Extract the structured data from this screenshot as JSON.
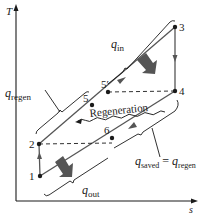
{
  "diagram": {
    "axes": {
      "y_label": "T",
      "x_label": "s"
    },
    "states": [
      {
        "id": "1",
        "label": "1"
      },
      {
        "id": "2",
        "label": "2"
      },
      {
        "id": "3",
        "label": "3"
      },
      {
        "id": "4",
        "label": "4"
      },
      {
        "id": "5",
        "label": "5"
      },
      {
        "id": "5p",
        "label": "5′"
      },
      {
        "id": "6",
        "label": "6"
      }
    ],
    "annotations": {
      "q_in": {
        "symbol": "q",
        "sub": "in"
      },
      "q_regen": {
        "symbol": "q",
        "sub": "regen"
      },
      "q_out": {
        "symbol": "q",
        "sub": "out"
      },
      "q_saved": {
        "symbol": "q",
        "sub": "saved",
        "equals": " = ",
        "symbol2": "q",
        "sub2": "regen"
      },
      "regeneration": "Regeneration"
    },
    "colors": {
      "line": "#1a1a1a",
      "process": "#555555",
      "heat_arrow": "#555555"
    }
  }
}
